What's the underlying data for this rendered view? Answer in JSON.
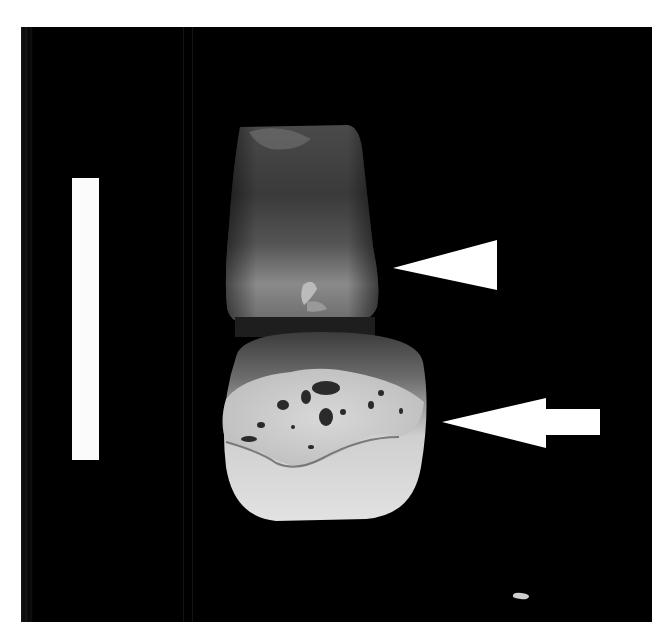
{
  "figure": {
    "background_color": "#000000",
    "page_color": "#ffffff",
    "annotations": {
      "scale_bar": {
        "color": "#fbfbfb",
        "orientation": "vertical"
      },
      "arrowhead": {
        "shape": "triangle",
        "color": "#ffffff",
        "points_to": "cervical region of root"
      },
      "arrow": {
        "shape": "block-arrow",
        "color": "#ffffff",
        "points_to": "crown lesion"
      }
    }
  }
}
